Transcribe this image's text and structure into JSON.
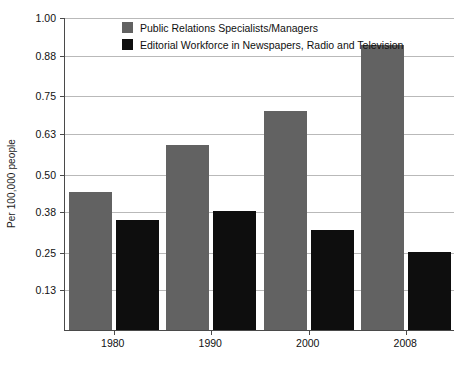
{
  "chart_data": {
    "type": "bar",
    "title": "",
    "subtitle": "",
    "xlabel": "",
    "ylabel": "Per 100,000 people",
    "categories": [
      "1980",
      "1990",
      "2000",
      "2008"
    ],
    "series": [
      {
        "name": "Public Relations Specialists/Managers",
        "color": "#626262",
        "values": [
          0.44,
          0.59,
          0.7,
          0.91
        ]
      },
      {
        "name": "Editorial Workforce in Newspapers, Radio and Television",
        "color": "#0e0e0e",
        "values": [
          0.35,
          0.38,
          0.32,
          0.25
        ]
      }
    ],
    "ylim": [
      0,
      1.0
    ],
    "yticks": [
      1.0,
      0.88,
      0.75,
      0.63,
      0.5,
      0.38,
      0.25,
      0.13
    ],
    "ytick_labels": [
      "1.00",
      "0.88",
      "0.75",
      "0.63",
      "0.50",
      "0.38",
      "0.25",
      "0.13"
    ],
    "grid": true,
    "legend_position": "top-center",
    "axis_color": "#4a4a4a",
    "grid_color": "#b9b9b9",
    "background": "#ffffff"
  }
}
